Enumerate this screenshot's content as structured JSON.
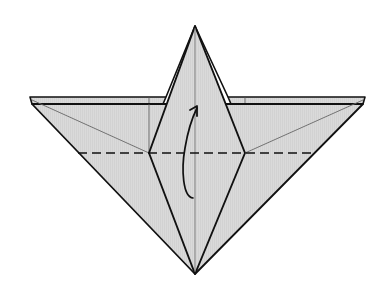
{
  "diagram": {
    "type": "origami-fold-step",
    "description": "Origami diagram: valley fold the lower flap upward along the dashed line",
    "colors": {
      "paper_fill": "#d9d9d9",
      "outline": "#111111",
      "crease": "#6a6a6a",
      "background": "#ffffff"
    },
    "symbols": {
      "fold_line": "valley-fold-dashed-line",
      "arrow": "curved-fold-up-arrow"
    },
    "points": {
      "top_apex": [
        195,
        26
      ],
      "bottom_apex": [
        195,
        274
      ],
      "left_tip_upper": [
        30,
        97
      ],
      "left_tip_lower": [
        32,
        104
      ],
      "right_tip_upper": [
        365,
        97
      ],
      "right_tip_lower": [
        363,
        104
      ],
      "left_diamond_vertex": [
        149,
        153
      ],
      "right_diamond_vertex": [
        245,
        153
      ]
    },
    "fold_line_y": 153
  }
}
